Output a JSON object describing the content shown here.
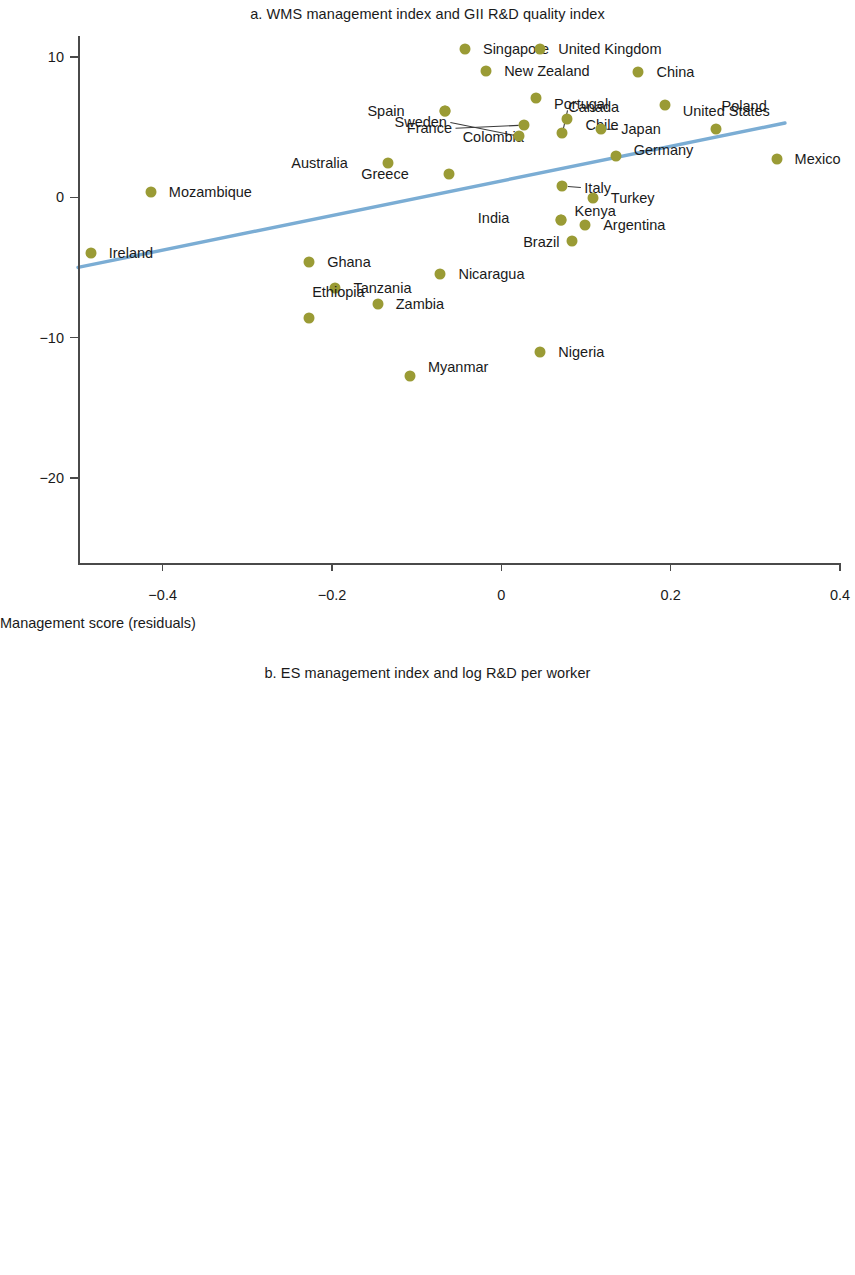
{
  "style": {
    "marker_color": "#9a9b35",
    "trend_color": "#7badd4",
    "axis_color": "#4a4a4a",
    "text_color": "#1a1a1a"
  },
  "chart_data": [
    {
      "type": "scatter",
      "panel": "a",
      "title": "a. WMS management index and GII R&D quality index",
      "xlabel": "Management score (residuals)",
      "ylabel": "R&D index (residuals)",
      "xlim": [
        -0.5,
        0.4
      ],
      "ylim": [
        -25,
        11.5
      ],
      "xticks": [
        -0.4,
        -0.2,
        0,
        0.2,
        0.4
      ],
      "xticklabels": [
        "−0.4",
        "−0.2",
        "0",
        "0.2",
        "0.4"
      ],
      "yticks": [
        10,
        0,
        -10,
        -20
      ],
      "yticklabels": [
        "10",
        "0",
        "−10",
        "−20"
      ],
      "grid": false,
      "legend": "none",
      "trendline": {
        "x0": -0.5,
        "y0": -5.0,
        "x1": 0.335,
        "y1": 5.3
      },
      "points": [
        {
          "label": "Singapore",
          "x": -0.043,
          "y": 10.55,
          "lx": 0.9,
          "ly": 0,
          "anchor": "start"
        },
        {
          "label": "United Kingdom",
          "x": 0.046,
          "y": 10.6,
          "lx": 0.9,
          "ly": 0,
          "anchor": "start"
        },
        {
          "label": "New Zealand",
          "x": -0.018,
          "y": 9.0,
          "lx": 0.9,
          "ly": 0,
          "anchor": "start"
        },
        {
          "label": "China",
          "x": 0.162,
          "y": 8.9,
          "lx": 0.9,
          "ly": 0,
          "anchor": "start"
        },
        {
          "label": "Portugal",
          "x": 0.041,
          "y": 7.05,
          "lx": 0.9,
          "ly": -0.35,
          "anchor": "start"
        },
        {
          "label": "Colombia",
          "x": -0.067,
          "y": 6.15,
          "lx": 0.9,
          "ly": -1.55,
          "anchor": "start"
        },
        {
          "label": "United States",
          "x": 0.193,
          "y": 6.55,
          "lx": 0.9,
          "ly": -0.3,
          "anchor": "start"
        },
        {
          "label": "Spain",
          "x": -0.067,
          "y": 6.15,
          "lx": -2.0,
          "ly": 0,
          "anchor": "end"
        },
        {
          "label": "Chile",
          "x": 0.078,
          "y": 5.6,
          "lx": 0.9,
          "ly": -0.35,
          "anchor": "start"
        },
        {
          "label": "France",
          "x": 0.027,
          "y": 5.15,
          "lx": -3.6,
          "ly": -0.2,
          "anchor": "end",
          "leader": true
        },
        {
          "label": "Sweden",
          "x": 0.021,
          "y": 4.35,
          "lx": -3.6,
          "ly": 0.85,
          "anchor": "end",
          "leader": true
        },
        {
          "label": "Canada",
          "x": 0.072,
          "y": 4.55,
          "lx": 0.3,
          "ly": 1.55,
          "anchor": "start",
          "leader": true
        },
        {
          "label": "Japan",
          "x": 0.118,
          "y": 4.85,
          "lx": 1.0,
          "ly": 0,
          "anchor": "start",
          "leader": true
        },
        {
          "label": "Poland",
          "x": 0.253,
          "y": 4.85,
          "lx": 0.3,
          "ly": 1.35,
          "anchor": "start"
        },
        {
          "label": "Germany",
          "x": 0.135,
          "y": 2.95,
          "lx": 0.9,
          "ly": 0.35,
          "anchor": "start"
        },
        {
          "label": "Mexico",
          "x": 0.325,
          "y": 2.75,
          "lx": 0.9,
          "ly": 0,
          "anchor": "start"
        },
        {
          "label": "Australia",
          "x": -0.134,
          "y": 2.45,
          "lx": -2.0,
          "ly": 0,
          "anchor": "end"
        },
        {
          "label": "Greece",
          "x": -0.062,
          "y": 1.65,
          "lx": -2.0,
          "ly": 0,
          "anchor": "end"
        },
        {
          "label": "Italy",
          "x": 0.072,
          "y": 0.8,
          "lx": 1.1,
          "ly": -0.1,
          "anchor": "start",
          "leader": true
        },
        {
          "label": "Mozambique",
          "x": -0.414,
          "y": 0.4,
          "lx": 0.9,
          "ly": 0,
          "anchor": "start"
        },
        {
          "label": "Turkey",
          "x": 0.108,
          "y": -0.05,
          "lx": 0.9,
          "ly": 0,
          "anchor": "start"
        },
        {
          "label": "Brazil",
          "x": 0.071,
          "y": -1.65,
          "lx": -0.1,
          "ly": -1.25,
          "anchor": "end"
        },
        {
          "label": "India",
          "x": 0.071,
          "y": -1.65,
          "lx": -2.6,
          "ly": 0.15,
          "anchor": "end"
        },
        {
          "label": "Argentina",
          "x": 0.099,
          "y": -2.0,
          "lx": 0.9,
          "ly": 0,
          "anchor": "start"
        },
        {
          "label": "Kenya",
          "x": 0.083,
          "y": -3.1,
          "lx": 0.15,
          "ly": 1.75,
          "anchor": "start"
        },
        {
          "label": "Ireland",
          "x": -0.485,
          "y": -3.95,
          "lx": 0.9,
          "ly": 0,
          "anchor": "start"
        },
        {
          "label": "Ghana",
          "x": -0.227,
          "y": -4.6,
          "lx": 0.9,
          "ly": 0,
          "anchor": "start"
        },
        {
          "label": "Nicaragua",
          "x": -0.072,
          "y": -5.45,
          "lx": 0.9,
          "ly": 0,
          "anchor": "start"
        },
        {
          "label": "Tanzania",
          "x": -0.196,
          "y": -6.45,
          "lx": 0.9,
          "ly": 0,
          "anchor": "start"
        },
        {
          "label": "Zambia",
          "x": -0.146,
          "y": -7.6,
          "lx": 0.9,
          "ly": 0,
          "anchor": "start"
        },
        {
          "label": "Ethiopia",
          "x": -0.227,
          "y": -8.6,
          "lx": 0.15,
          "ly": 1.5,
          "anchor": "start"
        },
        {
          "label": "Nigeria",
          "x": 0.046,
          "y": -11.0,
          "lx": 0.9,
          "ly": 0,
          "anchor": "start"
        },
        {
          "label": "Myanmar",
          "x": -0.108,
          "y": -12.75,
          "lx": 0.9,
          "ly": 0.55,
          "anchor": "start"
        }
      ]
    },
    {
      "type": "scatter",
      "panel": "b",
      "title": "b. ES management index and log R&D per worker",
      "xlabel": "Management score (residuals)",
      "ylabel": "Log R&D per worker residuals",
      "xlim": [
        -0.8,
        0.7
      ],
      "ylim": [
        -0.95,
        10.6
      ],
      "xticks": [
        -0.8,
        -0.5,
        -0.2,
        0.1,
        0.4,
        0.7
      ],
      "xticklabels": [
        "−0.8",
        "−0.5",
        "−0.2",
        "0.1",
        "0.4",
        "0.7"
      ],
      "yticks": [
        10,
        5,
        0
      ],
      "yticklabels": [
        "10",
        "5",
        "0"
      ],
      "grid": false,
      "legend": "none",
      "trendline": {
        "x0": -0.78,
        "y0": 3.32,
        "x1": 0.512,
        "y1": 6.78
      },
      "points": [
        {
          "label": "CZE",
          "x": 0.396,
          "y": 9.95,
          "lx": 0.9,
          "ly": -0.75,
          "anchor": "start"
        },
        {
          "label": "SRB",
          "x": 0.421,
          "y": 9.45,
          "lx": 0.9,
          "ly": 0,
          "anchor": "start"
        },
        {
          "label": "ISR",
          "x": -0.233,
          "y": 8.85,
          "lx": 0.9,
          "ly": 0,
          "anchor": "start"
        },
        {
          "label": "ALB",
          "x": 0.12,
          "y": 7.75,
          "lx": 0.9,
          "ly": 0,
          "anchor": "start"
        },
        {
          "label": "MNE",
          "x": 0.483,
          "y": 7.35,
          "lx": 0.9,
          "ly": -0.3,
          "anchor": "start"
        },
        {
          "label": "WBG",
          "x": -0.269,
          "y": 7.2,
          "lx": 0.9,
          "ly": 0,
          "anchor": "start"
        },
        {
          "label": "ARM",
          "x": -0.024,
          "y": 7.2,
          "lx": 0.9,
          "ly": 0,
          "anchor": "start"
        },
        {
          "label": "SVK",
          "x": 0.438,
          "y": 6.8,
          "lx": 0.9,
          "ly": -0.25,
          "anchor": "start"
        },
        {
          "label": "POL",
          "x": -0.498,
          "y": 6.55,
          "lx": 0.9,
          "ly": 0,
          "anchor": "start"
        },
        {
          "label": "KSV",
          "x": 0.047,
          "y": 6.5,
          "lx": 0.15,
          "ly": -0.72,
          "anchor": "start"
        },
        {
          "label": "RUS",
          "x": 0.337,
          "y": 6.35,
          "lx": 0.1,
          "ly": -0.68,
          "anchor": "start"
        },
        {
          "label": "LBN",
          "x": 0.219,
          "y": 6.25,
          "lx": 0.9,
          "ly": 0,
          "anchor": "start"
        },
        {
          "label": "YEM",
          "x": 0.153,
          "y": 5.9,
          "lx": 0.12,
          "ly": -0.85,
          "anchor": "start",
          "leader": true
        },
        {
          "label": "KAZ",
          "x": 0.095,
          "y": 5.75,
          "lx": 0.3,
          "ly": -0.85,
          "anchor": "start",
          "leader": true
        },
        {
          "label": "HRV",
          "x": 0.399,
          "y": 6.2,
          "lx": 0.9,
          "ly": 0.4,
          "anchor": "start"
        },
        {
          "label": "BGR",
          "x": -0.134,
          "y": 6.1,
          "lx": 0.9,
          "ly": 0,
          "anchor": "start"
        },
        {
          "label": "LVA",
          "x": 0.018,
          "y": 5.95,
          "lx": -1.3,
          "ly": 0,
          "anchor": "end",
          "leader": true
        },
        {
          "label": "MAR",
          "x": -0.455,
          "y": 5.8,
          "lx": 0.9,
          "ly": 0,
          "anchor": "start"
        },
        {
          "label": "MKD",
          "x": -0.069,
          "y": 5.6,
          "lx": -0.5,
          "ly": 0.5,
          "anchor": "end"
        },
        {
          "label": "LTU",
          "x": -0.195,
          "y": 5.8,
          "lx": -0.6,
          "ly": -0.45,
          "anchor": "end"
        },
        {
          "label": "TJK",
          "x": 0.525,
          "y": 5.65,
          "lx": 0.9,
          "ly": 0,
          "anchor": "start"
        },
        {
          "label": "HUN",
          "x": -0.226,
          "y": 5.45,
          "lx": 0.1,
          "ly": 0.7,
          "anchor": "start"
        },
        {
          "label": "JOR",
          "x": 0.168,
          "y": 5.35,
          "lx": 0.9,
          "ly": 0,
          "anchor": "start"
        },
        {
          "label": "BIH",
          "x": -0.04,
          "y": 5.4,
          "lx": -0.6,
          "ly": 0.5,
          "anchor": "end",
          "leader": true
        },
        {
          "label": "TUN",
          "x": 0.363,
          "y": 5.55,
          "lx": 0.9,
          "ly": 0,
          "anchor": "start"
        },
        {
          "label": "ROM",
          "x": 0.112,
          "y": 5.45,
          "lx": 0.1,
          "ly": 0.72,
          "anchor": "start",
          "leader": true
        },
        {
          "label": "BLR",
          "x": 0.355,
          "y": 5.35,
          "lx": 0.9,
          "ly": 0.25,
          "anchor": "start"
        },
        {
          "label": "MDA",
          "x": 0.064,
          "y": 5.4,
          "lx": -0.3,
          "ly": 0.78,
          "anchor": "end",
          "leader": true
        },
        {
          "label": "MNG",
          "x": 0.276,
          "y": 5.2,
          "lx": 0.05,
          "ly": 0.95,
          "anchor": "start",
          "leader": true
        },
        {
          "label": "PAK",
          "x": -0.783,
          "y": 5.05,
          "lx": 0.9,
          "ly": 0,
          "anchor": "start"
        },
        {
          "label": "TUR",
          "x": -0.145,
          "y": 5.1,
          "lx": 0.0,
          "ly": 0.7,
          "anchor": "start"
        },
        {
          "label": "KGZ",
          "x": -0.15,
          "y": 4.95,
          "lx": -0.5,
          "ly": 0.95,
          "anchor": "end"
        },
        {
          "label": "EGY",
          "x": 0.077,
          "y": 4.75,
          "lx": 0.25,
          "ly": 0.2,
          "anchor": "start",
          "leader": true
        },
        {
          "label": "GEO",
          "x": -0.093,
          "y": 4.75,
          "lx": 0.9,
          "ly": 0.3,
          "anchor": "start"
        },
        {
          "label": "KEN",
          "x": 0.029,
          "y": 3.7,
          "lx": 0.9,
          "ly": 0,
          "anchor": "start"
        },
        {
          "label": "DRC",
          "x": -0.711,
          "y": 3.2,
          "lx": 0.9,
          "ly": 0,
          "anchor": "start"
        },
        {
          "label": "GHA",
          "x": -0.23,
          "y": 3.2,
          "lx": 0.9,
          "ly": 0,
          "anchor": "start"
        },
        {
          "label": "ZMB",
          "x": -0.101,
          "y": 3.0,
          "lx": 0.9,
          "ly": 0,
          "anchor": "start"
        },
        {
          "label": "IND",
          "x": -0.138,
          "y": 2.75,
          "lx": 0.1,
          "ly": 0.6,
          "anchor": "start"
        },
        {
          "label": "TZA",
          "x": -0.045,
          "y": 2.55,
          "lx": 0.9,
          "ly": -0.22,
          "anchor": "start"
        },
        {
          "label": "BGD",
          "x": -0.035,
          "y": 2.35,
          "lx": 0.9,
          "ly": 0.2,
          "anchor": "start"
        },
        {
          "label": "NPL",
          "x": 0.037,
          "y": 2.15,
          "lx": 0.9,
          "ly": 0,
          "anchor": "start"
        },
        {
          "label": "UGA",
          "x": -0.195,
          "y": 1.65,
          "lx": 0.9,
          "ly": 0,
          "anchor": "start"
        },
        {
          "label": "UKR",
          "x": -0.755,
          "y": -0.3,
          "lx": 0.7,
          "ly": 0,
          "anchor": "start"
        }
      ]
    }
  ]
}
